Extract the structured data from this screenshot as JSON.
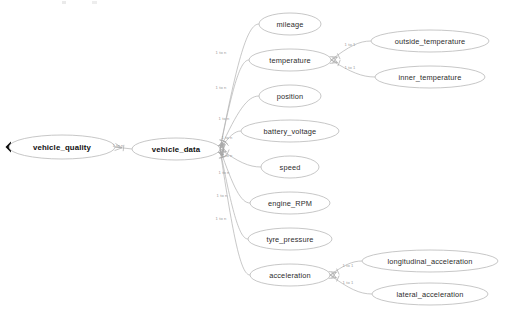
{
  "diagram": {
    "type": "entity-relationship-tree",
    "colors": {
      "node_stroke": "#b9b9b9",
      "node_fill": "#ffffff",
      "edge_stroke": "#b0b0b0",
      "label_text": "#2c2c2c",
      "edge_label_text": "#9a9a9a",
      "marker_fill": "#0a0a0a"
    },
    "nodes": [
      {
        "id": "vehicle_quality",
        "label": "vehicle_quality",
        "cx": 62,
        "cy": 147,
        "rx": 53,
        "ry": 12,
        "level": 0
      },
      {
        "id": "vehicle_data",
        "label": "vehicle_data",
        "cx": 176,
        "cy": 149,
        "rx": 44,
        "ry": 11,
        "level": 1
      },
      {
        "id": "mileage",
        "label": "mileage",
        "cx": 290,
        "cy": 24,
        "rx": 31,
        "ry": 11,
        "level": 2
      },
      {
        "id": "temperature",
        "label": "temperature",
        "cx": 290,
        "cy": 60,
        "rx": 41,
        "ry": 11,
        "level": 2
      },
      {
        "id": "position",
        "label": "position",
        "cx": 290,
        "cy": 96,
        "rx": 31,
        "ry": 11,
        "level": 2
      },
      {
        "id": "battery_voltage",
        "label": "battery_voltage",
        "cx": 290,
        "cy": 131,
        "rx": 49,
        "ry": 11,
        "level": 2
      },
      {
        "id": "speed",
        "label": "speed",
        "cx": 290,
        "cy": 167,
        "rx": 29,
        "ry": 11,
        "level": 2
      },
      {
        "id": "engine_RPM",
        "label": "engine_RPM",
        "cx": 290,
        "cy": 203,
        "rx": 40,
        "ry": 11,
        "level": 2
      },
      {
        "id": "tyre_pressure",
        "label": "tyre_pressure",
        "cx": 290,
        "cy": 239,
        "rx": 42,
        "ry": 11,
        "level": 2
      },
      {
        "id": "acceleration",
        "label": "acceleration",
        "cx": 290,
        "cy": 275,
        "rx": 40,
        "ry": 11,
        "level": 2
      },
      {
        "id": "outside_temperature",
        "label": "outside_temperature",
        "cx": 430,
        "cy": 41,
        "rx": 59,
        "ry": 11,
        "level": 3
      },
      {
        "id": "inner_temperature",
        "label": "inner_temperature",
        "cx": 430,
        "cy": 77,
        "rx": 55,
        "ry": 11,
        "level": 3
      },
      {
        "id": "longitudinal_acceleration",
        "label": "longitudinal_acceleration",
        "cx": 430,
        "cy": 261,
        "rx": 68,
        "ry": 11,
        "level": 3
      },
      {
        "id": "lateral_acceleration",
        "label": "lateral_acceleration",
        "cx": 430,
        "cy": 294,
        "rx": 58,
        "ry": 11,
        "level": 3
      }
    ],
    "edges": [
      {
        "from": "vehicle_quality",
        "to": "vehicle_data",
        "label": "1 to n",
        "lx": 118,
        "ly": 145
      },
      {
        "from": "vehicle_data",
        "to": "mileage",
        "label": "1 to n",
        "lx": 221,
        "ly": 52
      },
      {
        "from": "vehicle_data",
        "to": "temperature",
        "label": "1 to n",
        "lx": 221,
        "ly": 87
      },
      {
        "from": "vehicle_data",
        "to": "position",
        "label": "1 to n",
        "lx": 224,
        "ly": 118
      },
      {
        "from": "vehicle_data",
        "to": "battery_voltage",
        "label": "1 to n",
        "lx": 227,
        "ly": 137
      },
      {
        "from": "vehicle_data",
        "to": "speed",
        "label": "1 to n",
        "lx": 227,
        "ly": 155
      },
      {
        "from": "vehicle_data",
        "to": "engine_RPM",
        "label": "1 to n",
        "lx": 224,
        "ly": 172
      },
      {
        "from": "vehicle_data",
        "to": "tyre_pressure",
        "label": "1 to n",
        "lx": 222,
        "ly": 195
      },
      {
        "from": "vehicle_data",
        "to": "acceleration",
        "label": "1 to n",
        "lx": 221,
        "ly": 218
      },
      {
        "from": "temperature",
        "to": "outside_temperature",
        "label": "1 to 1",
        "lx": 350,
        "ly": 44
      },
      {
        "from": "temperature",
        "to": "inner_temperature",
        "label": "1 to 1",
        "lx": 350,
        "ly": 67
      },
      {
        "from": "acceleration",
        "to": "longitudinal_acceleration",
        "label": "1 to 1",
        "lx": 348,
        "ly": 265
      },
      {
        "from": "acceleration",
        "to": "lateral_acceleration",
        "label": "1 to 1",
        "lx": 348,
        "ly": 282
      }
    ]
  }
}
